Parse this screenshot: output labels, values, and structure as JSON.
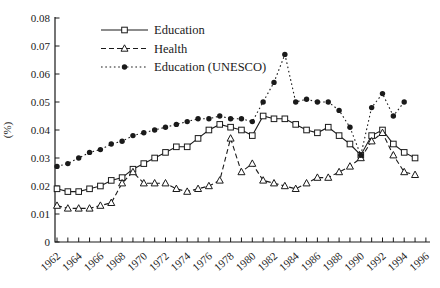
{
  "figure": {
    "ink_color": "#1a1a1a",
    "background_color": "#ffffff"
  },
  "chart_data": {
    "type": "line",
    "title": "",
    "xlabel": "",
    "ylabel": "(%)",
    "ylim": [
      0,
      0.08
    ],
    "ytick_step": 0.01,
    "ytick_labels": [
      "0",
      "0.01",
      "0.02",
      "0.03",
      "0.04",
      "0.05",
      "0.06",
      "0.07",
      "0.08"
    ],
    "x": [
      1962,
      1963,
      1964,
      1965,
      1966,
      1967,
      1968,
      1969,
      1970,
      1971,
      1972,
      1973,
      1974,
      1975,
      1976,
      1977,
      1978,
      1979,
      1980,
      1981,
      1982,
      1983,
      1984,
      1985,
      1986,
      1987,
      1988,
      1989,
      1990,
      1991,
      1992,
      1993,
      1994,
      1995,
      1996
    ],
    "xtick_label_every": 2,
    "xtick_labels": [
      "1962",
      "1964",
      "1966",
      "1968",
      "1970",
      "1972",
      "1974",
      "1976",
      "1978",
      "1980",
      "1982",
      "1984",
      "1986",
      "1988",
      "1990",
      "1992",
      "1994",
      "1996"
    ],
    "grid": false,
    "legend_position": "upper-left-inside",
    "series": [
      {
        "name": "Education",
        "line": "solid",
        "marker": "square-open",
        "values": [
          0.019,
          0.018,
          0.018,
          0.019,
          0.02,
          0.022,
          0.023,
          0.026,
          0.028,
          0.03,
          0.032,
          0.034,
          0.034,
          0.037,
          0.04,
          0.042,
          0.041,
          0.04,
          0.038,
          0.045,
          0.044,
          0.044,
          0.042,
          0.04,
          0.039,
          0.041,
          0.038,
          0.035,
          0.031,
          0.038,
          0.04,
          0.035,
          0.032,
          0.03,
          null
        ]
      },
      {
        "name": "Health",
        "line": "dashed",
        "marker": "triangle-open",
        "values": [
          0.013,
          0.012,
          0.012,
          0.012,
          0.013,
          0.014,
          0.021,
          0.025,
          0.021,
          0.021,
          0.021,
          0.019,
          0.018,
          0.019,
          0.02,
          0.022,
          0.037,
          0.025,
          0.028,
          0.022,
          0.021,
          0.02,
          0.019,
          0.021,
          0.023,
          0.023,
          0.025,
          0.027,
          0.03,
          0.036,
          0.039,
          0.031,
          0.025,
          0.024,
          null
        ]
      },
      {
        "name": "Education (UNESCO)",
        "line": "dotted",
        "marker": "circle-filled",
        "values": [
          0.027,
          0.028,
          0.03,
          0.032,
          0.033,
          0.035,
          0.036,
          0.038,
          0.039,
          0.04,
          0.041,
          0.042,
          0.043,
          0.044,
          0.044,
          0.045,
          0.044,
          0.044,
          0.043,
          0.05,
          0.057,
          0.067,
          0.05,
          0.051,
          0.05,
          0.05,
          0.047,
          0.041,
          0.031,
          0.048,
          0.053,
          0.045,
          0.05,
          null,
          null
        ]
      }
    ]
  }
}
